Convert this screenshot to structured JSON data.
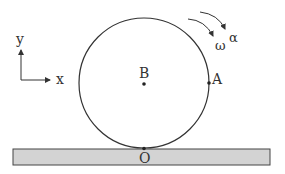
{
  "diagram": {
    "axes": {
      "x_label": "x",
      "y_label": "y"
    },
    "points": {
      "center": "B",
      "right_point": "A",
      "contact_point": "O"
    },
    "rotation": {
      "angular_velocity": "ω",
      "angular_acceleration": "α"
    },
    "colors": {
      "line": "#333333",
      "ground_fill": "#d3d3d3",
      "background": "#ffffff"
    }
  }
}
